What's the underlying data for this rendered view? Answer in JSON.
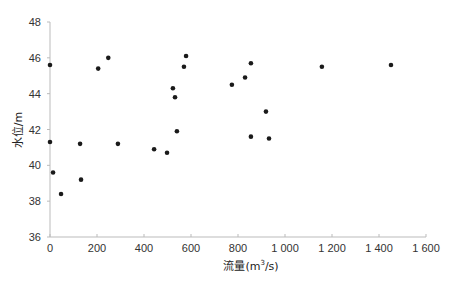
{
  "chart_data": {
    "type": "scatter",
    "title": "",
    "xlabel": "流量(m³/s)",
    "xlabel_parts": {
      "pre": "流量(m",
      "sup": "3",
      "post": "/s)"
    },
    "ylabel": "水位/m",
    "xlim": [
      0,
      1600
    ],
    "ylim": [
      36,
      48
    ],
    "grid": false,
    "legend": null,
    "x_ticks": [
      0,
      200,
      400,
      600,
      800,
      1000,
      1200,
      1400,
      1600
    ],
    "x_tick_labels": [
      "0",
      "200",
      "400",
      "600",
      "800",
      "1 000",
      "1 200",
      "1 400",
      "1 600"
    ],
    "y_ticks": [
      36,
      38,
      40,
      42,
      44,
      46,
      48
    ],
    "y_tick_labels": [
      "36",
      "38",
      "40",
      "42",
      "44",
      "46",
      "48"
    ],
    "points": [
      {
        "x": 0,
        "y": 45.6
      },
      {
        "x": 0,
        "y": 41.3
      },
      {
        "x": 13,
        "y": 39.6
      },
      {
        "x": 47,
        "y": 38.4
      },
      {
        "x": 128,
        "y": 41.2
      },
      {
        "x": 132,
        "y": 39.2
      },
      {
        "x": 205,
        "y": 45.4
      },
      {
        "x": 248,
        "y": 46.0
      },
      {
        "x": 289,
        "y": 41.2
      },
      {
        "x": 443,
        "y": 40.9
      },
      {
        "x": 498,
        "y": 40.7
      },
      {
        "x": 523,
        "y": 44.3
      },
      {
        "x": 532,
        "y": 43.8
      },
      {
        "x": 540,
        "y": 41.9
      },
      {
        "x": 570,
        "y": 45.5
      },
      {
        "x": 579,
        "y": 46.1
      },
      {
        "x": 774,
        "y": 44.5
      },
      {
        "x": 830,
        "y": 44.9
      },
      {
        "x": 855,
        "y": 45.7
      },
      {
        "x": 855,
        "y": 41.6
      },
      {
        "x": 919,
        "y": 43.0
      },
      {
        "x": 932,
        "y": 41.5
      },
      {
        "x": 1157,
        "y": 45.5
      },
      {
        "x": 1451,
        "y": 45.6
      }
    ],
    "marker_color": "#1a1a1a"
  }
}
